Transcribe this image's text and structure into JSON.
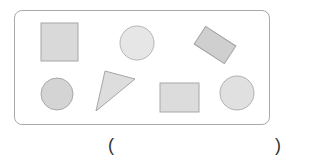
{
  "figure": {
    "frame": {
      "x": 14,
      "y": 10,
      "width": 256,
      "height": 115,
      "radius": 8,
      "stroke": "#a9a9a9"
    },
    "shapes": [
      {
        "type": "square",
        "label": "square",
        "x": 41,
        "y": 23,
        "width": 37,
        "height": 38,
        "fill": "#d9d9d9",
        "stroke": "#a6a6a6"
      },
      {
        "type": "circle",
        "label": "circle",
        "cx": 137,
        "cy": 43,
        "r": 17,
        "fill": "#e6e6e6",
        "stroke": "#b5b5b5"
      },
      {
        "type": "rotated-rectangle",
        "label": "rectangle",
        "cx": 215,
        "cy": 45,
        "width": 36,
        "height": 21,
        "rotation": 33,
        "fill": "#cfcfcf",
        "stroke": "#a0a0a0"
      },
      {
        "type": "circle",
        "label": "circle",
        "cx": 57,
        "cy": 94,
        "r": 16,
        "fill": "#d4d4d4",
        "stroke": "#a8a8a8"
      },
      {
        "type": "triangle",
        "label": "triangle",
        "points": "105,71 135,79 96,111",
        "fill": "#dddddd",
        "stroke": "#a6a6a6"
      },
      {
        "type": "rectangle",
        "label": "rectangle",
        "x": 160,
        "y": 83,
        "width": 39,
        "height": 29,
        "fill": "#dcdcdc",
        "stroke": "#a8a8a8"
      },
      {
        "type": "circle",
        "label": "circle",
        "cx": 237,
        "cy": 93,
        "r": 17,
        "fill": "#e0e0e0",
        "stroke": "#b0b0b0"
      }
    ]
  },
  "answer": {
    "open_paren": "(",
    "close_paren": ")",
    "value": ""
  }
}
